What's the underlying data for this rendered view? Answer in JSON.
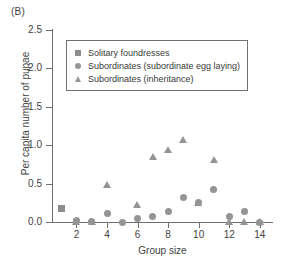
{
  "panel": {
    "label": "(B)"
  },
  "legend": {
    "entries": [
      {
        "marker": "square",
        "label": "Solitary foundresses"
      },
      {
        "marker": "circle",
        "label": "Subordinates (subordinate egg laying)"
      },
      {
        "marker": "triangle",
        "label": "Subordinates (inheritance)"
      }
    ]
  },
  "colors": {
    "square": "#8c8c8c",
    "circle": "#949494",
    "triangle": "#949494",
    "axis": "#6f6f6f",
    "text": "#3a3a3a",
    "background": "#ffffff"
  },
  "axes": {
    "y_ticks": [
      "0.0",
      "0.5",
      "1.0",
      "1.5",
      "2.0",
      "2.5"
    ],
    "x_ticks": [
      "2",
      "4",
      "6",
      "8",
      "10",
      "12",
      "14"
    ]
  },
  "chart_data": {
    "type": "scatter",
    "title": "",
    "xlabel": "Group size",
    "ylabel": "Per capita number of pupae",
    "xlim": [
      0.4,
      14.8
    ],
    "ylim": [
      0.0,
      2.5
    ],
    "yticks": [
      0.0,
      0.5,
      1.0,
      1.5,
      2.0,
      2.5
    ],
    "xticks": [
      2,
      4,
      6,
      8,
      10,
      12,
      14
    ],
    "grid": false,
    "legend_position": "upper-left-inside",
    "series": [
      {
        "name": "Solitary foundresses",
        "marker": "square",
        "color": "#8c8c8c",
        "points": [
          {
            "x": 1,
            "y": 0.17
          }
        ]
      },
      {
        "name": "Subordinates (subordinate egg laying)",
        "marker": "circle",
        "color": "#949494",
        "points": [
          {
            "x": 2,
            "y": 0.02
          },
          {
            "x": 3,
            "y": 0.01
          },
          {
            "x": 4,
            "y": 0.11
          },
          {
            "x": 5,
            "y": -0.01
          },
          {
            "x": 6,
            "y": 0.05
          },
          {
            "x": 7,
            "y": 0.07
          },
          {
            "x": 8,
            "y": 0.14
          },
          {
            "x": 9,
            "y": 0.32
          },
          {
            "x": 10,
            "y": 0.25
          },
          {
            "x": 11,
            "y": 0.42
          },
          {
            "x": 12,
            "y": 0.07
          },
          {
            "x": 13,
            "y": 0.14
          },
          {
            "x": 14,
            "y": 0.0
          }
        ]
      },
      {
        "name": "Subordinates (inheritance)",
        "marker": "triangle",
        "color": "#949494",
        "points": [
          {
            "x": 2,
            "y": 0.0
          },
          {
            "x": 3,
            "y": 0.0
          },
          {
            "x": 4,
            "y": 0.48
          },
          {
            "x": 6,
            "y": 0.22
          },
          {
            "x": 7,
            "y": 0.85
          },
          {
            "x": 8,
            "y": 0.93
          },
          {
            "x": 9,
            "y": 1.07
          },
          {
            "x": 10,
            "y": 0.25
          },
          {
            "x": 11,
            "y": 0.8
          },
          {
            "x": 12,
            "y": 0.0
          },
          {
            "x": 13,
            "y": 0.0
          },
          {
            "x": 14,
            "y": 0.0
          }
        ]
      }
    ]
  }
}
